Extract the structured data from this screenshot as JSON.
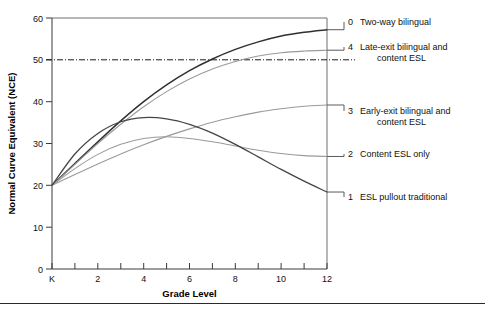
{
  "chart_data": {
    "type": "line",
    "title": "",
    "xlabel": "Grade Level",
    "ylabel": "Normal Curve Equivalent (NCE)",
    "xlim": [
      0,
      12
    ],
    "ylim": [
      0,
      60
    ],
    "grid": false,
    "legend_position": "right",
    "x_tick_labels": [
      "K",
      "2",
      "4",
      "6",
      "8",
      "10",
      "12"
    ],
    "x_tick_values": [
      0,
      2,
      4,
      6,
      8,
      10,
      12
    ],
    "x_minor_ticks": [
      1,
      3,
      5,
      7,
      9,
      11
    ],
    "y_tick_labels": [
      "0",
      "10",
      "20",
      "30",
      "40",
      "50",
      "60"
    ],
    "y_tick_values": [
      0,
      10,
      20,
      30,
      40,
      50,
      60
    ],
    "reference_line": {
      "label": "50th NCE",
      "value": 50,
      "style": "dash-dot"
    },
    "x": [
      0,
      1,
      2,
      3,
      4,
      5,
      6,
      7,
      8,
      9,
      10,
      11,
      12
    ],
    "series": [
      {
        "key": "0",
        "name": "Two-way bilingual",
        "color": "#303030",
        "width": 1.5,
        "values": [
          20,
          25.2,
          30.4,
          35.4,
          40.0,
          44.0,
          47.4,
          50.2,
          52.5,
          54.3,
          55.7,
          56.6,
          57.2
        ]
      },
      {
        "key": "4",
        "name": "Late-exit bilingual and content ESL",
        "color": "#9a9a9a",
        "width": 1.1,
        "values": [
          20,
          25.0,
          30.0,
          34.6,
          38.8,
          42.4,
          45.4,
          47.8,
          49.6,
          50.9,
          51.7,
          52.1,
          52.3
        ]
      },
      {
        "key": "3",
        "name": "Early-exit bilingual and content ESL",
        "color": "#9a9a9a",
        "width": 1.1,
        "values": [
          20,
          22.6,
          25.1,
          27.5,
          29.7,
          31.7,
          33.5,
          35.1,
          36.4,
          37.5,
          38.3,
          38.9,
          39.2
        ]
      },
      {
        "key": "2",
        "name": "Content ESL only",
        "color": "#9a9a9a",
        "width": 1.1,
        "values": [
          20,
          24.0,
          27.4,
          29.8,
          31.2,
          31.6,
          31.2,
          30.4,
          29.4,
          28.4,
          27.6,
          27.1,
          26.9
        ]
      },
      {
        "key": "1",
        "name": "ESL pullout traditional",
        "color": "#454545",
        "width": 1.3,
        "values": [
          20,
          27.5,
          32.4,
          35.2,
          36.2,
          35.9,
          34.6,
          32.5,
          29.8,
          26.8,
          23.8,
          21.0,
          18.4
        ]
      }
    ],
    "legend_entries": [
      {
        "key": "0",
        "lines": [
          "Two-way bilingual"
        ],
        "endpoint_value": 57.2
      },
      {
        "key": "4",
        "lines": [
          "Late-exit bilingual and",
          "content ESL"
        ],
        "endpoint_value": 52.3
      },
      {
        "key": "3",
        "lines": [
          "Early-exit bilingual and",
          "content ESL"
        ],
        "endpoint_value": 39.2
      },
      {
        "key": "2",
        "lines": [
          "Content ESL only"
        ],
        "endpoint_value": 26.9
      },
      {
        "key": "1",
        "lines": [
          "ESL pullout traditional"
        ],
        "endpoint_value": 18.4
      }
    ]
  }
}
